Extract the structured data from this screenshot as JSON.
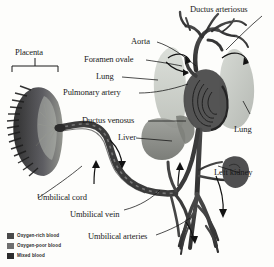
{
  "figure": {
    "background_color": "#fdfdfb",
    "label_color": "#1a1a1a"
  },
  "labels": {
    "placenta": "Placenta",
    "ductus_arteriosus": "Ductus arteriosus",
    "aorta": "Aorta",
    "foramen_ovale": "Foramen ovale",
    "lung_left": "Lung",
    "pulmonary_artery": "Pulmonary artery",
    "ductus_venosus": "Ductus venosus",
    "liver": "Liver",
    "lung_right": "Lung",
    "left_kidney": "Left kidney",
    "umbilical_cord": "Umbilical cord",
    "umbilical_vein": "Umbilical vein",
    "umbilical_arteries": "Umbilical arteries"
  },
  "legend": {
    "items": [
      {
        "label": "Oxygen-rich blood",
        "color": "#4a4a4a"
      },
      {
        "label": "Oxygen-poor blood",
        "color": "#6f6f6f"
      },
      {
        "label": "Mixed blood",
        "color": "#2c2c2c"
      }
    ]
  },
  "anatomy": {
    "colors": {
      "vessel_dark": "#3a3a3a",
      "vessel_mid": "#5e5e5e",
      "organ_light": "#c9cdc6",
      "organ_mid": "#8f918c",
      "organ_dark": "#59595a",
      "placenta_dark": "#2e2e2e"
    },
    "parts": [
      "placenta",
      "umbilical cord",
      "umbilical vein",
      "umbilical arteries",
      "ductus venosus",
      "liver",
      "left lung",
      "right lung",
      "heart",
      "aorta",
      "pulmonary artery",
      "ductus arteriosus",
      "foramen ovale",
      "left kidney"
    ]
  }
}
